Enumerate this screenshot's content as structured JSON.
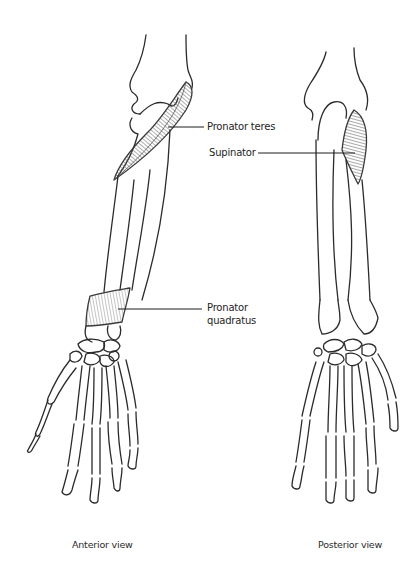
{
  "figure": {
    "views": [
      {
        "id": "anterior",
        "caption": "Anterior view"
      },
      {
        "id": "posterior",
        "caption": "Posterior view"
      }
    ],
    "labels": {
      "pronator_teres": "Pronator teres",
      "supinator": "Supinator",
      "pronator_quadratus_line1": "Pronator",
      "pronator_quadratus_line2": "quadratus"
    },
    "colors": {
      "ink": "#2b2b2b",
      "muscle_shade": "#8a8a8a",
      "background": "#ffffff"
    }
  }
}
